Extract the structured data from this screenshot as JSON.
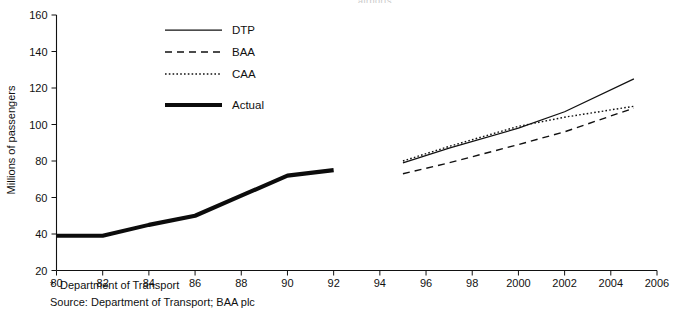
{
  "figure": {
    "truncated_title": "airports",
    "y_axis_title": "Millions of passengers",
    "footnote_marker": "*",
    "footnote": "Department of Transport",
    "source": "Source: Department of Transport; BAA plc"
  },
  "legend": {
    "items": [
      {
        "label": "DTP",
        "style": "solid-thin",
        "name": "legend-dtp"
      },
      {
        "label": "BAA",
        "style": "dashed",
        "name": "legend-baa"
      },
      {
        "label": "CAA",
        "style": "dotted",
        "name": "legend-caa"
      },
      {
        "label": "Actual",
        "style": "solid-thick",
        "name": "legend-actual"
      }
    ]
  },
  "chart_data": {
    "type": "line",
    "title": "",
    "xlabel": "",
    "ylabel": "Millions of passengers",
    "xlim": [
      1980,
      2006
    ],
    "ylim": [
      20,
      160
    ],
    "ytick_labels": [
      "20",
      "40",
      "60",
      "80",
      "100",
      "120",
      "140",
      "160"
    ],
    "ytick_values": [
      20,
      40,
      60,
      80,
      100,
      120,
      140,
      160
    ],
    "xtick_labels": [
      "80",
      "82",
      "84",
      "86",
      "88",
      "90",
      "92",
      "94",
      "96",
      "98",
      "2000",
      "2002",
      "2004",
      "2006"
    ],
    "xtick_values": [
      1980,
      1982,
      1984,
      1986,
      1988,
      1990,
      1992,
      1994,
      1996,
      1998,
      2000,
      2002,
      2004,
      2006
    ],
    "grid": false,
    "legend_position": "top-center",
    "series": [
      {
        "name": "Actual",
        "style": "solid-thick",
        "x": [
          1980,
          1982,
          1984,
          1986,
          1988,
          1990,
          1992
        ],
        "values": [
          39,
          39,
          45,
          50,
          61,
          72,
          75
        ]
      },
      {
        "name": "DTP",
        "style": "solid-thin",
        "x": [
          1995,
          1997,
          2000,
          2002,
          2005
        ],
        "values": [
          79,
          87,
          98,
          107,
          125
        ]
      },
      {
        "name": "BAA",
        "style": "dashed",
        "x": [
          1995,
          1997,
          2000,
          2002,
          2005
        ],
        "values": [
          73,
          79,
          89,
          96,
          109
        ]
      },
      {
        "name": "CAA",
        "style": "dotted",
        "x": [
          1995,
          1997,
          2000,
          2002,
          2005
        ],
        "values": [
          80,
          88,
          99,
          104,
          110
        ]
      }
    ]
  }
}
